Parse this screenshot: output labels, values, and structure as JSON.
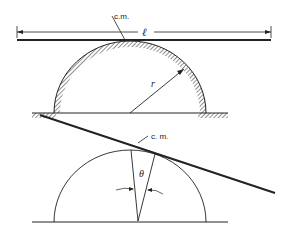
{
  "diagram": {
    "top_figure": {
      "description": "Rod of length l resting horizontally on top of a fixed half-cylinder of radius r",
      "cm_label": "c.m.",
      "length_label": "ℓ",
      "radius_label": "r"
    },
    "bottom_figure": {
      "description": "Rod tilted by angle theta, rolling without slipping on the half-cylinder",
      "cm_label": "c. m.",
      "angle_label": "θ"
    },
    "colors": {
      "line": "#222222",
      "background": "#ffffff"
    }
  }
}
